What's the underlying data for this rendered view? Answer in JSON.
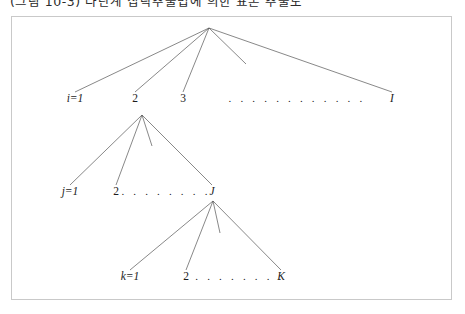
{
  "caption": {
    "text": "(그림 10-3)  다단계 집락추출법에 의한 표본 추출도"
  },
  "figure": {
    "border_color": "#c9c9c9",
    "line_color": "#555555",
    "background": "#ffffff"
  },
  "tree": {
    "levels": [
      {
        "name": "level-1",
        "parent_label": "root",
        "parent_x": 209,
        "parent_y": 28,
        "label_y": 101,
        "nodes": [
          {
            "label": "i=1",
            "x": 75,
            "italic": true
          },
          {
            "label": "2",
            "x": 135,
            "italic": false
          },
          {
            "label": "3",
            "x": 183,
            "italic": false
          },
          {
            "label": "I",
            "x": 392,
            "italic": true
          }
        ],
        "dots": {
          "text": ". . . . . . . . . . . .",
          "x": 297
        },
        "stub": {
          "x": 246,
          "y": 64
        }
      },
      {
        "name": "level-2",
        "parent_label": "2",
        "parent_x": 142,
        "parent_y": 115,
        "label_y": 194,
        "nodes": [
          {
            "label": "j=1",
            "x": 70,
            "italic": true
          },
          {
            "label": "2",
            "x": 116,
            "italic": false
          },
          {
            "label": "J",
            "x": 212,
            "italic": true
          }
        ],
        "dots": {
          "text": ". . . . . . . .",
          "x": 166
        },
        "stub": {
          "x": 152,
          "y": 146
        }
      },
      {
        "name": "level-3",
        "parent_label": "J",
        "parent_x": 213,
        "parent_y": 201,
        "label_y": 279,
        "nodes": [
          {
            "label": "k=1",
            "x": 130,
            "italic": true
          },
          {
            "label": "2",
            "x": 186,
            "italic": false
          },
          {
            "label": "K",
            "x": 281,
            "italic": true
          }
        ],
        "dots": {
          "text": ". . . . . . . . .",
          "x": 234
        },
        "stub": {
          "x": 220,
          "y": 233
        }
      }
    ]
  }
}
